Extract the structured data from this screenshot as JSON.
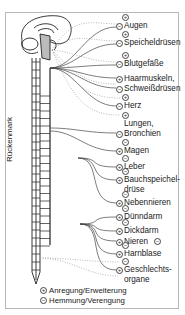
{
  "diagram": {
    "spine_label": "Rückenmark",
    "organs": [
      {
        "label": "Augen",
        "symbol_top": "+",
        "symbol_near": "−"
      },
      {
        "label": "Speicheldrüsen",
        "symbol_top": "+",
        "symbol_near": "−"
      },
      {
        "label": "Blutgefäße",
        "symbol_top": "+",
        "symbol_near": "−"
      },
      {
        "label": "Haarmuskeln,",
        "symbol_near": "+"
      },
      {
        "label": "Schweißdrüsen",
        "symbol_near": "−"
      },
      {
        "label": "Herz",
        "symbol_top": "+",
        "symbol_near": "−"
      },
      {
        "label": "Lungen,",
        "symbol_top": "+"
      },
      {
        "label": "Bronchien",
        "symbol_near": "−"
      },
      {
        "label": "Magen",
        "symbol_top": "−",
        "symbol_near": "+"
      },
      {
        "label": "Leber",
        "symbol_top": "−",
        "symbol_near": "+"
      },
      {
        "label": "Bauchspeichel-",
        "symbol_top": "−",
        "symbol_near": "+"
      },
      {
        "label": "drüse"
      },
      {
        "label": "Nebennieren",
        "symbol_top": "−",
        "symbol_near": "+"
      },
      {
        "label": "Dünndarm",
        "symbol_top": "−",
        "symbol_near": "+"
      },
      {
        "label": "Dickdarm",
        "symbol_top": "−",
        "symbol_near": "+"
      },
      {
        "label": "Nieren",
        "symbol_after": "−",
        "symbol_near": "+"
      },
      {
        "label": "Harnblase",
        "symbol_top": "−",
        "symbol_near": "+"
      },
      {
        "label": "Geschlechts-",
        "symbol_top": "−",
        "symbol_near": "+"
      },
      {
        "label": "organe"
      }
    ],
    "legend": [
      {
        "symbol": "+",
        "label": "Anregung/Erweiterung"
      },
      {
        "symbol": "−",
        "label": "Hemmung/Verengung"
      }
    ]
  }
}
